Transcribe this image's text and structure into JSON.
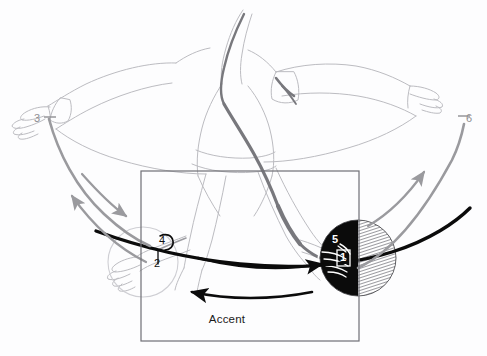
{
  "figure": {
    "title": "Accent",
    "caption_label": "Accent",
    "background_color": "#fdfdfe",
    "ink_black": "#111111",
    "ink_gray": "#9a9a9e",
    "ink_light": "#c9c9cd",
    "frame_color": "#6f6f75"
  },
  "frame": {
    "name": "accent-zone",
    "label": "Accent",
    "x": 141,
    "y": 171,
    "width": 218,
    "height": 170
  },
  "markers": [
    {
      "id": "1",
      "label": "1",
      "x": 342,
      "y": 258,
      "style": "boxed-white",
      "desc": "contact point on struck ball"
    },
    {
      "id": "2",
      "label": "2",
      "x": 157,
      "y": 262,
      "style": "plain-black",
      "desc": "low point near ghost ball"
    },
    {
      "id": "3",
      "label": "3",
      "x": 36,
      "y": 120,
      "style": "plain-gray",
      "desc": "left arm end of upswing"
    },
    {
      "id": "4",
      "label": "4",
      "x": 162,
      "y": 241,
      "style": "plain-black",
      "desc": "hook above ghost ball"
    },
    {
      "id": "5",
      "label": "5",
      "x": 336,
      "y": 240,
      "style": "plain-white",
      "desc": "upper contact on struck ball"
    },
    {
      "id": "6",
      "label": "6",
      "x": 464,
      "y": 120,
      "style": "plain-gray",
      "desc": "right arm end of upswing"
    }
  ],
  "balls": [
    {
      "name": "struck-ball",
      "cx": 358,
      "cy": 258,
      "r": 38,
      "fill_left": "#0b0b0b",
      "fill_right": "hatched-gray"
    },
    {
      "name": "ghost-ball",
      "cx": 143,
      "cy": 262,
      "r": 35,
      "fill": "none",
      "stroke": "#cfcfd4"
    }
  ],
  "arrows": {
    "black_forward": {
      "name": "forward-swing-arrow",
      "direction": "right",
      "desc": "upper black arrow sweeping right"
    },
    "black_return": {
      "name": "return-swing-arrow",
      "direction": "left",
      "desc": "lower black arrow sweeping left"
    },
    "gray_left_up": {
      "name": "left-rebound-arrow",
      "direction": "up-left"
    },
    "gray_left_down": {
      "name": "left-descent-arrow",
      "direction": "down-right"
    },
    "gray_right_up": {
      "name": "right-rebound-arrow",
      "direction": "up-right"
    }
  },
  "paths": {
    "main_trajectory": {
      "name": "main-stroke-path",
      "color": "#0b0b0b",
      "desc": "thick black arc from ghost ball to struck ball"
    },
    "left_sweep": {
      "name": "left-gray-sweep",
      "color": "#9a9a9e"
    },
    "right_sweep": {
      "name": "right-gray-sweep",
      "color": "#9a9a9e"
    }
  },
  "drawing": {
    "subject": "line-art figure of a player leaning forward with both arms extended",
    "stroke_color": "#b9b9be",
    "shade_color": "#6e6e73"
  }
}
